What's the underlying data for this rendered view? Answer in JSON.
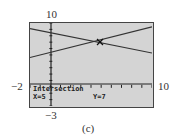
{
  "labels": {
    "ymax": "10",
    "ymin": "−3",
    "xmin": "−2",
    "xmax": "10",
    "caption": "(c)"
  },
  "screen": {
    "mode": "Intersection",
    "x_readout": "X=5",
    "y_readout": "Y=7"
  },
  "chart_data": {
    "type": "line",
    "title": "",
    "xlim": [
      -2,
      10
    ],
    "ylim": [
      -3,
      10
    ],
    "grid": false,
    "series": [
      {
        "name": "rising line",
        "x": [
          -2,
          10
        ],
        "y": [
          4.6,
          9.4
        ]
      },
      {
        "name": "falling line",
        "x": [
          -2,
          10
        ],
        "y": [
          9.1,
          5.3
        ]
      }
    ],
    "annotations": [
      {
        "text": "Intersection X=5 Y=7",
        "x": 5,
        "y": 7
      }
    ],
    "xlabel": "",
    "ylabel": ""
  }
}
